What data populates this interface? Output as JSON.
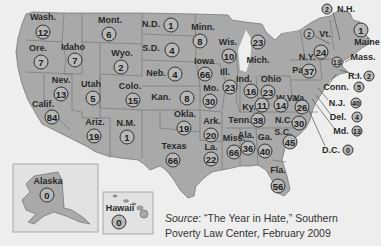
{
  "map": {
    "title_hidden": "",
    "fill_color": "#a9a9a9",
    "background_color": "#eeeeee",
    "states": [
      {
        "id": "wash",
        "label": "Wash.",
        "count": "12",
        "lx": 43,
        "ly": 17,
        "bx": 43,
        "by": 32
      },
      {
        "id": "ore",
        "label": "Ore.",
        "count": "7",
        "lx": 38,
        "ly": 48,
        "bx": 41,
        "by": 62
      },
      {
        "id": "idaho",
        "label": "Idaho",
        "count": "7",
        "lx": 73,
        "ly": 47,
        "bx": 75,
        "by": 60
      },
      {
        "id": "mont",
        "label": "Mont.",
        "count": "6",
        "lx": 110,
        "ly": 20,
        "bx": 109,
        "by": 34
      },
      {
        "id": "wyo",
        "label": "Wyo.",
        "count": "2",
        "lx": 122,
        "ly": 53,
        "bx": 121,
        "by": 67
      },
      {
        "id": "nev",
        "label": "Nev.",
        "count": "13",
        "lx": 61,
        "ly": 80,
        "bx": 61,
        "by": 94
      },
      {
        "id": "calif",
        "label": "Calif.",
        "count": "84",
        "lx": 43,
        "ly": 104,
        "bx": 52,
        "by": 117
      },
      {
        "id": "utah",
        "label": "Utah",
        "count": "5",
        "lx": 91,
        "ly": 84,
        "bx": 93,
        "by": 98
      },
      {
        "id": "colo",
        "label": "Colo.",
        "count": "15",
        "lx": 130,
        "ly": 86,
        "bx": 133,
        "by": 100
      },
      {
        "id": "ariz",
        "label": "Ariz.",
        "count": "19",
        "lx": 95,
        "ly": 122,
        "bx": 94,
        "by": 136
      },
      {
        "id": "nm",
        "label": "N.M.",
        "count": "1",
        "lx": 126,
        "ly": 123,
        "bx": 127,
        "by": 137
      },
      {
        "id": "nd",
        "label": "N.D.",
        "count": "1",
        "lx": 151,
        "ly": 24,
        "bx": 171,
        "by": 25
      },
      {
        "id": "sd",
        "label": "S.D.",
        "count": "4",
        "lx": 151,
        "ly": 48,
        "bx": 172,
        "by": 50
      },
      {
        "id": "neb",
        "label": "Neb.",
        "count": "4",
        "lx": 156,
        "ly": 73,
        "bx": 175,
        "by": 74
      },
      {
        "id": "kan",
        "label": "Kan.",
        "count": "8",
        "lx": 161,
        "ly": 97,
        "bx": 187,
        "by": 98
      },
      {
        "id": "okla",
        "label": "Okla.",
        "count": "19",
        "lx": 185,
        "ly": 114,
        "bx": 184,
        "by": 128
      },
      {
        "id": "texas",
        "label": "Texas",
        "count": "66",
        "lx": 174,
        "ly": 146,
        "bx": 173,
        "by": 160
      },
      {
        "id": "minn",
        "label": "Minn.",
        "count": "8",
        "lx": 203,
        "ly": 27,
        "bx": 200,
        "by": 41
      },
      {
        "id": "iowa",
        "label": "Iowa",
        "count": "66",
        "lx": 204,
        "ly": 61,
        "bx": 205,
        "by": 74
      },
      {
        "id": "mo",
        "label": "Mo.",
        "count": "30",
        "lx": 211,
        "ly": 88,
        "bx": 210,
        "by": 101
      },
      {
        "id": "ark",
        "label": "Ark.",
        "count": "20",
        "lx": 212,
        "ly": 121,
        "bx": 211,
        "by": 135
      },
      {
        "id": "la",
        "label": "La.",
        "count": "22",
        "lx": 211,
        "ly": 147,
        "bx": 211,
        "by": 159
      },
      {
        "id": "wis",
        "label": "Wis.",
        "count": "10",
        "lx": 228,
        "ly": 42,
        "bx": 229,
        "by": 56
      },
      {
        "id": "ill",
        "label": "Ill.",
        "count": "23",
        "lx": 225,
        "ly": 72,
        "bx": 230,
        "by": 87
      },
      {
        "id": "miss",
        "label": "Miss.",
        "count": "66",
        "lx": 234,
        "ly": 138,
        "bx": 234,
        "by": 152
      },
      {
        "id": "mich",
        "label": "Mich.",
        "count": "23",
        "lx": 258,
        "ly": 60,
        "bx": 258,
        "by": 42
      },
      {
        "id": "ind",
        "label": "Ind.",
        "count": "16",
        "lx": 244,
        "ly": 79,
        "bx": 251,
        "by": 91
      },
      {
        "id": "ohio",
        "label": "Ohio",
        "count": "23",
        "lx": 271,
        "ly": 79,
        "bx": 268,
        "by": 92
      },
      {
        "id": "ky",
        "label": "Ky.",
        "count": "11",
        "lx": 249,
        "ly": 107,
        "bx": 262,
        "by": 105
      },
      {
        "id": "wva",
        "label": "W.Va.",
        "count": "14",
        "lx": 288,
        "ly": 98,
        "bx": 281,
        "by": 105
      },
      {
        "id": "va",
        "label": "Va.",
        "count": "26",
        "lx": 300,
        "ly": 98,
        "bx": 302,
        "by": 107
      },
      {
        "id": "tenn",
        "label": "Tenn.",
        "count": "38",
        "lx": 240,
        "ly": 120,
        "bx": 258,
        "by": 120
      },
      {
        "id": "nc",
        "label": "N.C.",
        "count": "30",
        "lx": 284,
        "ly": 120,
        "bx": 299,
        "by": 123
      },
      {
        "id": "sc",
        "label": "S.C.",
        "count": "45",
        "lx": 283,
        "ly": 132,
        "bx": 290,
        "by": 142
      },
      {
        "id": "ala",
        "label": "Ala.",
        "count": "36",
        "lx": 246,
        "ly": 135,
        "bx": 248,
        "by": 148
      },
      {
        "id": "ga",
        "label": "Ga.",
        "count": "40",
        "lx": 265,
        "ly": 137,
        "bx": 265,
        "by": 151
      },
      {
        "id": "fla",
        "label": "Fla.",
        "count": "56",
        "lx": 278,
        "ly": 170,
        "bx": 278,
        "by": 186
      },
      {
        "id": "pa",
        "label": "Pa.",
        "count": "37",
        "lx": 299,
        "ly": 70,
        "bx": 309,
        "by": 71
      },
      {
        "id": "ny",
        "label": "N.Y.",
        "count": "24",
        "lx": 307,
        "ly": 57,
        "bx": 321,
        "by": 52
      },
      {
        "id": "maine",
        "label": "Maine",
        "count": "1",
        "lx": 367,
        "ly": 42,
        "bx": 361,
        "by": 30
      }
    ],
    "callouts": [
      {
        "id": "nh",
        "label": "N.H.",
        "count": "2",
        "bx": 327,
        "by": 9,
        "lx": 346,
        "ly": 9
      },
      {
        "id": "vt",
        "label": "Vt.",
        "count": "2",
        "bx": 309,
        "by": 34,
        "lx": 325,
        "ly": 34,
        "ox": 0,
        "oy": 0
      },
      {
        "id": "mass",
        "label": "Mass.",
        "count": "13",
        "bx": 337,
        "by": 62,
        "lx": 363,
        "ly": 57
      },
      {
        "id": "ri",
        "label": "R.I.",
        "count": "2",
        "bx": 369,
        "by": 76,
        "lx": 355,
        "ly": 76
      },
      {
        "id": "conn",
        "label": "Conn.",
        "count": "5",
        "bx": 359,
        "by": 87,
        "lx": 336,
        "ly": 87
      },
      {
        "id": "nj",
        "label": "N.J.",
        "count": "40",
        "bx": 356,
        "by": 103,
        "lx": 337,
        "ly": 103
      },
      {
        "id": "del",
        "label": "Del.",
        "count": "4",
        "bx": 357,
        "by": 117,
        "lx": 338,
        "ly": 117
      },
      {
        "id": "md",
        "label": "Md.",
        "count": "13",
        "bx": 357,
        "by": 131,
        "lx": 341,
        "ly": 131
      },
      {
        "id": "dc",
        "label": "D.C.",
        "count": "0",
        "bx": 348,
        "by": 150,
        "lx": 331,
        "ly": 150
      }
    ],
    "insets": [
      {
        "id": "alaska",
        "label": "Alaska",
        "count": "0",
        "lx": 48,
        "ly": 181,
        "bx": 47,
        "by": 195
      },
      {
        "id": "hawaii",
        "label": "Hawaii",
        "count": "0",
        "lx": 120,
        "ly": 208,
        "bx": 119,
        "by": 222
      }
    ]
  },
  "source": {
    "prefix": "Source",
    "text_line1": ": “The Year in Hate,” Southern",
    "text_line2": "Poverty Law Center, February 2009"
  }
}
